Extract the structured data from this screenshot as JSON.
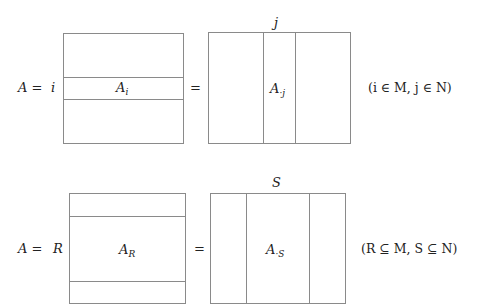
{
  "row1": {
    "lhs": "A =",
    "row_index_label": "i",
    "left_matrix": {
      "main": "A",
      "sub": "i"
    },
    "equals": "=",
    "col_index_label": "j",
    "right_matrix": {
      "main": "A",
      "sub": "·j"
    },
    "condition": "(i ∈ M,  j ∈ N)"
  },
  "row2": {
    "lhs": "A =",
    "row_index_label": "R",
    "left_matrix": {
      "main": "A",
      "sub": "R"
    },
    "equals": "=",
    "col_index_label": "S",
    "right_matrix": {
      "main": "A",
      "sub": "·S"
    },
    "condition": "(R ⊆ M,  S ⊆ N)"
  }
}
